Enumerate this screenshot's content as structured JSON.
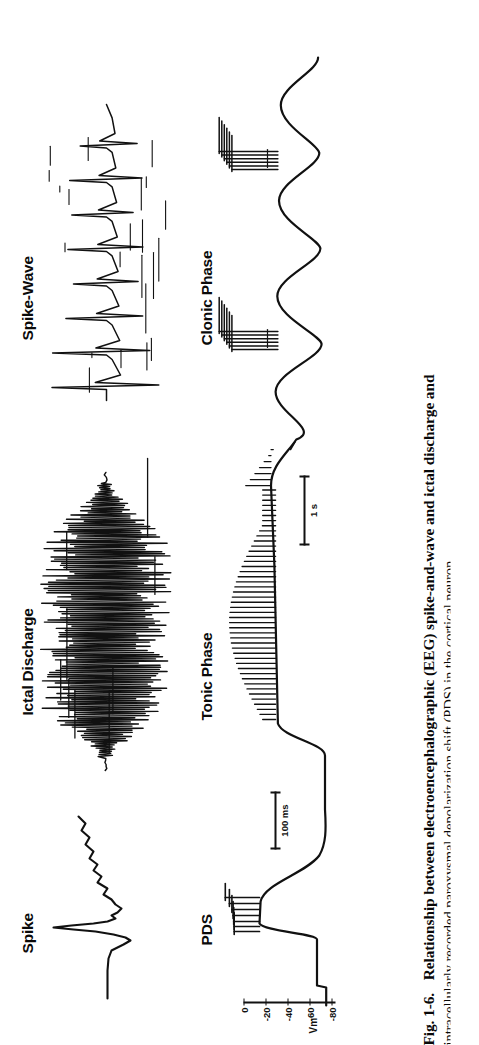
{
  "figure": {
    "id": "Fig. 1-6.",
    "caption_line1": "Relationship between electroencephalographic (EEG) spike-and-wave and ictal discharge and",
    "caption_line2": "intracellularly recorded paroxysmal depolarization shift (PDS) in the cortical neuron."
  },
  "panels": {
    "eeg_row": [
      {
        "key": "spike",
        "label": "Spike"
      },
      {
        "key": "ictal",
        "label": "Ictal Discharge"
      },
      {
        "key": "sw",
        "label": "Spike-Wave"
      }
    ],
    "intracellular_row": [
      {
        "key": "pds",
        "label": "PDS"
      },
      {
        "key": "tonic",
        "label": "Tonic Phase"
      },
      {
        "key": "clonic",
        "label": "Clonic Phase"
      }
    ]
  },
  "axis": {
    "name": "Vm",
    "unit": "mV",
    "ticks": [
      "0",
      "-20",
      "-40",
      "-60",
      "-80"
    ],
    "tick_values": [
      0,
      -20,
      -40,
      -60,
      -80
    ]
  },
  "scalebars": [
    {
      "key": "time-left",
      "label": "100 ms"
    },
    {
      "key": "time-right",
      "label": "1 s"
    }
  ],
  "colors": {
    "ink": "#0a0a0a",
    "paper": "#ffffff"
  },
  "chart_data": {
    "type": "line",
    "xlabel": "Time",
    "ylabel": "Vm (mV)",
    "ylim": [
      -90,
      10
    ],
    "yticks": [
      0,
      -20,
      -40,
      -60,
      -80
    ],
    "grid": false,
    "legend": "none",
    "panels": [
      {
        "name": "Spike",
        "row": "EEG",
        "description": "Single sharp EEG transient: small negative dip, large positive spike, slow after-wave",
        "x": [
          0,
          6,
          12,
          16,
          20,
          24,
          27,
          30,
          33,
          36,
          40,
          44,
          48,
          52,
          56,
          60,
          66,
          74,
          82,
          92,
          100
        ],
        "y": [
          0,
          0,
          -2,
          -6,
          -3,
          4,
          22,
          34,
          18,
          2,
          -10,
          -7,
          -12,
          -6,
          -10,
          -4,
          -8,
          -3,
          -6,
          -2,
          -2
        ]
      },
      {
        "name": "Ictal Discharge",
        "row": "EEG",
        "description": "High-frequency high-amplitude polyspike burst lasting several seconds",
        "burst_frequency_hz": 18,
        "relative_amplitude": 1.0
      },
      {
        "name": "Spike-Wave",
        "row": "EEG",
        "description": "Repetitive spike-and-wave complexes, roughly 3 per second, decreasing amplitude",
        "complexes": 8,
        "frequency_hz": 3
      },
      {
        "name": "PDS",
        "row": "Intracellular",
        "description": "Paroxysmal depolarization shift: resting -70 mV, abrupt depolarization to about -20 mV crowned by a burst of action potentials, then afterhyperpolarization",
        "resting_mv": -70,
        "plateau_mv": -20,
        "spike_peak_mv": 5,
        "x": [
          0,
          10,
          18,
          22,
          26,
          30,
          38,
          50,
          64,
          80,
          95,
          100
        ],
        "y": [
          -70,
          -70,
          -68,
          -40,
          -22,
          -20,
          -21,
          -26,
          -45,
          -66,
          -72,
          -72
        ]
      },
      {
        "name": "Tonic Phase",
        "row": "Intracellular",
        "description": "Sustained depolarization with continuous high-frequency action potential firing",
        "plateau_mv": -35,
        "firing_pattern": "continuous tonic"
      },
      {
        "name": "Clonic Phase",
        "row": "Intracellular",
        "description": "Rhythmic oscillation of membrane potential with bursts of action potentials on each depolarizing crest",
        "oscillation_hz": 2,
        "burst_count": 2
      }
    ]
  }
}
